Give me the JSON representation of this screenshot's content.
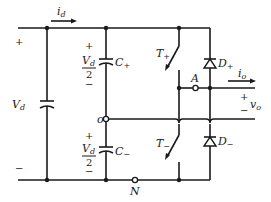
{
  "diagram": {
    "type": "half-bridge inverter circuit",
    "labels": {
      "id_main": "i",
      "id_sub": "d",
      "vd_main": "V",
      "vd_sub": "d",
      "plus": "+",
      "minus": "−",
      "cplus_main": "C",
      "cplus_sub": "+",
      "cminus_main": "C",
      "cminus_sub": "−",
      "half_num_main": "V",
      "half_num_sub": "d",
      "half_den": "2",
      "tplus_main": "T",
      "tplus_sub": "+",
      "tminus_main": "T",
      "tminus_sub": "−",
      "dplus_main": "D",
      "dplus_sub": "+",
      "dminus_main": "D",
      "dminus_sub": "−",
      "node_a": "A",
      "node_o": "o",
      "node_n": "N",
      "io_main": "i",
      "io_sub": "o",
      "vo_main": "v",
      "vo_sub": "o"
    }
  }
}
